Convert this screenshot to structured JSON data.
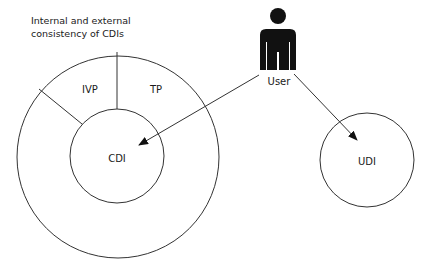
{
  "diagram": {
    "caption_lines": [
      "Internal and external",
      "consistency of CDIs"
    ],
    "outer_ring": {
      "segments": [
        {
          "label": "IVP"
        },
        {
          "label": "TP"
        }
      ]
    },
    "inner_circle": {
      "label": "CDI"
    },
    "actor": {
      "label": "User",
      "icon": "user-silhouette-icon"
    },
    "external_circle": {
      "label": "UDI"
    },
    "arrows": [
      {
        "from": "User",
        "to": "CDI"
      },
      {
        "from": "User",
        "to": "UDI"
      }
    ],
    "colors": {
      "stroke": "#333333",
      "fill_actor": "#111111",
      "background": "#ffffff"
    }
  }
}
